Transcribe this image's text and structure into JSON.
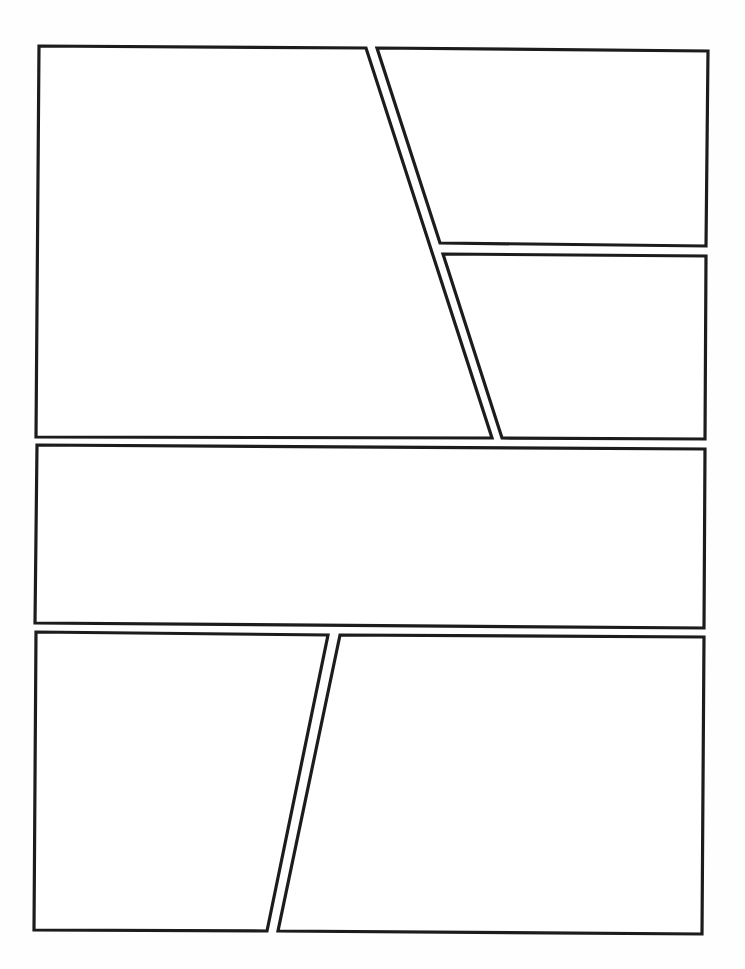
{
  "page": {
    "width": 745,
    "height": 969,
    "background": "#fefefe",
    "border_color": "#1c1c1c",
    "border_width": 3.2
  },
  "panels": [
    {
      "id": "panel-1",
      "row": 1,
      "points": [
        [
          39,
          46
        ],
        [
          366,
          48
        ],
        [
          492,
          438
        ],
        [
          36,
          437
        ]
      ]
    },
    {
      "id": "panel-2",
      "row": 1,
      "points": [
        [
          377,
          48
        ],
        [
          708,
          51
        ],
        [
          706,
          246
        ],
        [
          440,
          243
        ]
      ]
    },
    {
      "id": "panel-3",
      "row": 1,
      "points": [
        [
          443,
          254
        ],
        [
          706,
          256
        ],
        [
          705,
          439
        ],
        [
          502,
          438
        ]
      ]
    },
    {
      "id": "panel-4",
      "row": 2,
      "points": [
        [
          37,
          445
        ],
        [
          705,
          449
        ],
        [
          704,
          628
        ],
        [
          35,
          623
        ]
      ]
    },
    {
      "id": "panel-5",
      "row": 3,
      "points": [
        [
          36,
          632
        ],
        [
          328,
          635
        ],
        [
          267,
          931
        ],
        [
          34,
          930
        ]
      ]
    },
    {
      "id": "panel-6",
      "row": 3,
      "points": [
        [
          340,
          635
        ],
        [
          704,
          637
        ],
        [
          702,
          934
        ],
        [
          278,
          931
        ]
      ]
    }
  ]
}
